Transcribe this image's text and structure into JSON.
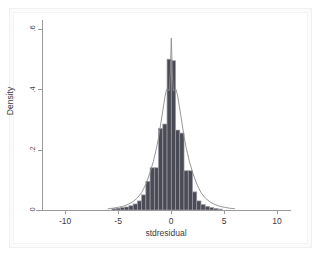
{
  "chart_data": {
    "type": "bar",
    "title": "",
    "subtitle": "",
    "xlabel": "stdresidual",
    "ylabel": "Density",
    "xlim": [
      -12.2,
      11.2
    ],
    "ylim": [
      0,
      0.63
    ],
    "grid": false,
    "legend": null,
    "xticks": [
      -10,
      -5,
      0,
      5,
      10
    ],
    "xticklabels": [
      "-10",
      "-5",
      "0",
      "5",
      "10"
    ],
    "yticks": [
      0,
      0.2,
      0.4,
      0.6
    ],
    "yticklabels": [
      "0",
      ".2",
      ".4",
      ".6"
    ],
    "bar_fill_color": "#4b4b55",
    "bar_edge_color": "#9a9aa4",
    "density_line_color": "#8c8c8c",
    "axis_color": "#9a9a9a",
    "plot_background": "#ffffff",
    "canvas_background": "#fbfbfb",
    "bin_width": 0.4,
    "series": [
      {
        "name": "histogram",
        "type": "bar",
        "bin_centers": [
          -5.4,
          -5.0,
          -4.6,
          -4.2,
          -3.8,
          -3.4,
          -3.0,
          -2.6,
          -2.2,
          -1.8,
          -1.4,
          -1.0,
          -0.6,
          -0.2,
          0.2,
          0.6,
          1.0,
          1.4,
          1.8,
          2.2,
          2.6,
          3.0,
          3.4,
          3.8,
          4.2,
          4.6
        ],
        "values": [
          0.004,
          0.006,
          0.008,
          0.01,
          0.014,
          0.02,
          0.03,
          0.05,
          0.095,
          0.14,
          0.14,
          0.27,
          0.285,
          0.5,
          0.495,
          0.265,
          0.255,
          0.13,
          0.13,
          0.06,
          0.03,
          0.018,
          0.012,
          0.008,
          0.005,
          0.003
        ]
      },
      {
        "name": "density",
        "type": "line",
        "x": [
          -6.0,
          -5.5,
          -5.0,
          -4.5,
          -4.0,
          -3.6,
          -3.2,
          -2.8,
          -2.4,
          -2.0,
          -1.7,
          -1.4,
          -1.2,
          -1.0,
          -0.8,
          -0.6,
          -0.45,
          -0.3,
          -0.2,
          -0.1,
          0.0,
          0.1,
          0.2,
          0.3,
          0.45,
          0.6,
          0.8,
          1.0,
          1.2,
          1.4,
          1.7,
          2.0,
          2.4,
          2.8,
          3.2,
          3.6,
          4.0,
          4.5,
          5.0,
          5.5,
          6.0
        ],
        "values": [
          0.004,
          0.006,
          0.009,
          0.013,
          0.02,
          0.028,
          0.04,
          0.058,
          0.085,
          0.125,
          0.16,
          0.205,
          0.24,
          0.285,
          0.33,
          0.375,
          0.4,
          0.4,
          0.395,
          0.45,
          0.57,
          0.45,
          0.395,
          0.398,
          0.4,
          0.378,
          0.335,
          0.29,
          0.245,
          0.207,
          0.162,
          0.126,
          0.086,
          0.058,
          0.04,
          0.028,
          0.02,
          0.013,
          0.009,
          0.006,
          0.004
        ]
      }
    ]
  },
  "axes": {
    "x_title": "stdresidual",
    "y_title": "Density"
  }
}
